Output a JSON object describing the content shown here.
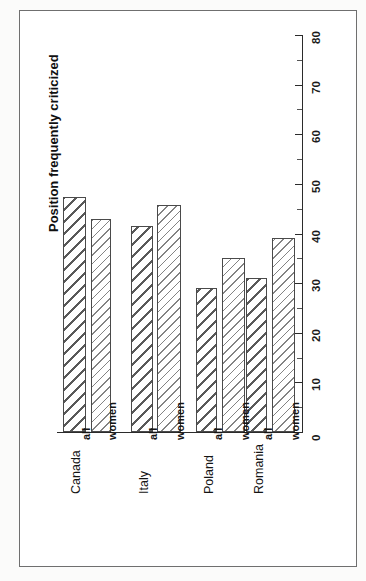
{
  "figure": {
    "caption": "Fig. 3 Readiness to Accept Different Types of Promotion †",
    "subtitle": "Position frequently criticized"
  },
  "chart_data": {
    "type": "bar",
    "title": "Position frequently criticized",
    "orientation": "vertical-bars-rotated-page",
    "categories": [
      "Canada",
      "Italy",
      "Poland",
      "Romania"
    ],
    "series": [
      {
        "name": "all",
        "values": [
          47.4,
          41.5,
          29.0,
          31.0
        ]
      },
      {
        "name": "women",
        "values": [
          43.0,
          45.8,
          35.0,
          39.0
        ]
      }
    ],
    "xlabel": "",
    "ylabel": "",
    "ylim": [
      0,
      80
    ],
    "ytick_major": [
      0,
      10,
      20,
      30,
      40,
      50,
      60,
      70,
      80
    ],
    "ytick_minor_step": 5,
    "grid": false,
    "legend": "none",
    "series_labels_inline": true,
    "hatch": {
      "all": "coarse-diagonal",
      "women": "fine-diagonal"
    }
  },
  "axis": {
    "tick_labels": [
      "0",
      "10",
      "20",
      "30",
      "40",
      "50",
      "60",
      "70",
      "80"
    ]
  },
  "groups": [
    {
      "label": "Canada",
      "bars": [
        {
          "series": "all",
          "value": 47.4
        },
        {
          "series": "women",
          "value": 43.0
        }
      ]
    },
    {
      "label": "Italy",
      "bars": [
        {
          "series": "all",
          "value": 41.5
        },
        {
          "series": "women",
          "value": 45.8
        }
      ]
    },
    {
      "label": "Poland",
      "bars": [
        {
          "series": "all",
          "value": 29.0
        },
        {
          "series": "women",
          "value": 35.0
        }
      ]
    },
    {
      "label": "Romania",
      "bars": [
        {
          "series": "all",
          "value": 31.0
        },
        {
          "series": "women",
          "value": 39.0
        }
      ]
    }
  ],
  "series_names": {
    "all": "all",
    "women": "women"
  },
  "colors": {
    "page_background": "#fbfbfa",
    "plot_background": "#ffffff",
    "frame_border": "#6f6f6f",
    "axis": "#2b2b2b",
    "bar_outline": "#4a4a4a",
    "text": "#141414"
  }
}
